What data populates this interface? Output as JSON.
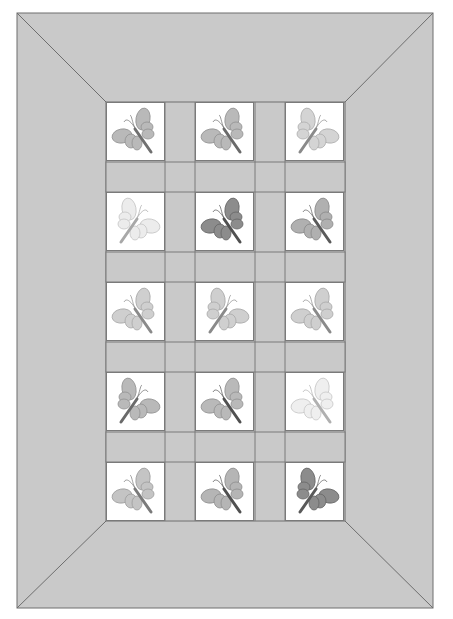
{
  "quilt": {
    "title": "Butterfly quilt pattern",
    "border_color": "#c9c9c9",
    "sashing_color": "#c9c9c9",
    "line_color": "#6e6e6e",
    "block_background": "#ffffff",
    "grid": {
      "columns": 3,
      "rows": 5
    },
    "blocks": [
      {
        "row": 1,
        "col": 1,
        "wing": "#b9b9b9",
        "body": "#707070",
        "facing": "right"
      },
      {
        "row": 1,
        "col": 2,
        "wing": "#b9b9b9",
        "body": "#6a6a6a",
        "facing": "right"
      },
      {
        "row": 1,
        "col": 3,
        "wing": "#d4d4d4",
        "body": "#8a8a8a",
        "facing": "left"
      },
      {
        "row": 2,
        "col": 1,
        "wing": "#ececec",
        "body": "#a8a8a8",
        "facing": "left"
      },
      {
        "row": 2,
        "col": 2,
        "wing": "#8c8c8c",
        "body": "#505050",
        "facing": "right"
      },
      {
        "row": 2,
        "col": 3,
        "wing": "#b0b0b0",
        "body": "#5a5a5a",
        "facing": "right"
      },
      {
        "row": 3,
        "col": 1,
        "wing": "#cfcfcf",
        "body": "#8a8a8a",
        "facing": "right"
      },
      {
        "row": 3,
        "col": 2,
        "wing": "#cfcfcf",
        "body": "#8a8a8a",
        "facing": "left"
      },
      {
        "row": 3,
        "col": 3,
        "wing": "#cfcfcf",
        "body": "#8a8a8a",
        "facing": "right"
      },
      {
        "row": 4,
        "col": 1,
        "wing": "#b9b9b9",
        "body": "#6a6a6a",
        "facing": "left"
      },
      {
        "row": 4,
        "col": 2,
        "wing": "#b9b9b9",
        "body": "#505050",
        "facing": "right"
      },
      {
        "row": 4,
        "col": 3,
        "wing": "#efefef",
        "body": "#b0b0b0",
        "facing": "right"
      },
      {
        "row": 5,
        "col": 1,
        "wing": "#c4c4c4",
        "body": "#7a7a7a",
        "facing": "right"
      },
      {
        "row": 5,
        "col": 2,
        "wing": "#b5b5b5",
        "body": "#505050",
        "facing": "right"
      },
      {
        "row": 5,
        "col": 3,
        "wing": "#8c8c8c",
        "body": "#5a5a5a",
        "facing": "left"
      }
    ]
  }
}
